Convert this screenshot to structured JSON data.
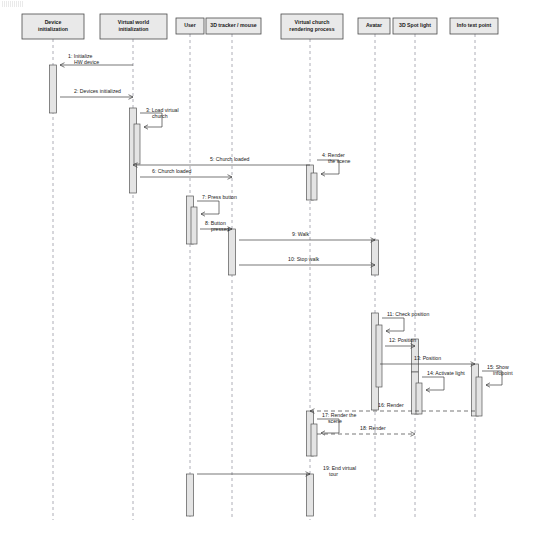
{
  "diagram": {
    "type": "uml-sequence-diagram",
    "canvas": {
      "width": 536,
      "height": 543
    },
    "colors": {
      "background": "#ffffff",
      "header_fill": "#e9e9e9",
      "header_stroke": "#4a4a4a",
      "activation_fill": "#e4e4e4",
      "activation_stroke": "#565656",
      "lifeline": "#9a9aa5",
      "message": "#3c3c3c",
      "text": "#1a1a1a"
    }
  },
  "lifelines": [
    {
      "id": "device-initialization",
      "label": "Device initialization",
      "x": 53,
      "box": {
        "x": 22,
        "y": 14,
        "w": 62,
        "h": 25
      },
      "lifeline_bottom": 520
    },
    {
      "id": "virtual-world-initialization",
      "label": "Virtual world initialization",
      "x": 133,
      "box": {
        "x": 100,
        "y": 14,
        "w": 67,
        "h": 25
      },
      "lifeline_bottom": 520
    },
    {
      "id": "user",
      "label": "User",
      "x": 190,
      "box": {
        "x": 176,
        "y": 18,
        "w": 28,
        "h": 16
      },
      "lifeline_bottom": 520
    },
    {
      "id": "tracker-mouse",
      "label": "3D tracker / mouse",
      "x": 232,
      "box": {
        "x": 206,
        "y": 18,
        "w": 55,
        "h": 16
      },
      "lifeline_bottom": 520
    },
    {
      "id": "virtual-church-rendering-process",
      "label": "Virtual church rendering process",
      "x": 310,
      "box": {
        "x": 281,
        "y": 14,
        "w": 62,
        "h": 25
      },
      "lifeline_bottom": 520
    },
    {
      "id": "avatar",
      "label": "Avatar",
      "x": 375,
      "box": {
        "x": 358,
        "y": 18,
        "w": 32,
        "h": 16
      },
      "lifeline_bottom": 520
    },
    {
      "id": "spot-light",
      "label": "3D Spot light",
      "x": 415,
      "box": {
        "x": 393,
        "y": 18,
        "w": 44,
        "h": 16
      },
      "lifeline_bottom": 520
    },
    {
      "id": "info-text-point",
      "label": "Info text point",
      "x": 475,
      "box": {
        "x": 450,
        "y": 18,
        "w": 48,
        "h": 16
      },
      "lifeline_bottom": 520
    }
  ],
  "activations": [
    {
      "id": "act-device-1",
      "lifeline": "device-initialization",
      "x": 53,
      "y": 65,
      "w": 7,
      "h": 48
    },
    {
      "id": "act-vworld-1",
      "lifeline": "virtual-world-initialization",
      "x": 133,
      "y": 108,
      "w": 7,
      "h": 85
    },
    {
      "id": "act-vworld-self",
      "lifeline": "virtual-world-initialization",
      "x": 137,
      "y": 124,
      "w": 6,
      "h": 40
    },
    {
      "id": "act-user-1",
      "lifeline": "user",
      "x": 190,
      "y": 196,
      "w": 7,
      "h": 48
    },
    {
      "id": "act-user-self",
      "lifeline": "user",
      "x": 194,
      "y": 207,
      "w": 6,
      "h": 37
    },
    {
      "id": "act-tracker-1",
      "lifeline": "tracker-mouse",
      "x": 232,
      "y": 229,
      "w": 7,
      "h": 46
    },
    {
      "id": "act-church-1",
      "lifeline": "virtual-church-rendering-process",
      "x": 310,
      "y": 165,
      "w": 7,
      "h": 35
    },
    {
      "id": "act-church-self",
      "lifeline": "virtual-church-rendering-process",
      "x": 314,
      "y": 173,
      "w": 6,
      "h": 27
    },
    {
      "id": "act-avatar-1",
      "lifeline": "avatar",
      "x": 375,
      "y": 240,
      "w": 7,
      "h": 35
    },
    {
      "id": "act-avatar-2",
      "lifeline": "avatar",
      "x": 375,
      "y": 313,
      "w": 7,
      "h": 97
    },
    {
      "id": "act-avatar-self",
      "lifeline": "avatar",
      "x": 379,
      "y": 325,
      "w": 6,
      "h": 62
    },
    {
      "id": "act-spot-1",
      "lifeline": "spot-light",
      "x": 415,
      "y": 339,
      "w": 7,
      "h": 33
    },
    {
      "id": "act-spot-2",
      "lifeline": "spot-light",
      "x": 415,
      "y": 372,
      "w": 7,
      "h": 42
    },
    {
      "id": "act-spot-self",
      "lifeline": "spot-light",
      "x": 419,
      "y": 383,
      "w": 6,
      "h": 31
    },
    {
      "id": "act-info-1",
      "lifeline": "info-text-point",
      "x": 475,
      "y": 364,
      "w": 7,
      "h": 52
    },
    {
      "id": "act-info-self",
      "lifeline": "info-text-point",
      "x": 479,
      "y": 377,
      "w": 6,
      "h": 39
    },
    {
      "id": "act-church-2",
      "lifeline": "virtual-church-rendering-process",
      "x": 310,
      "y": 411,
      "w": 7,
      "h": 45
    },
    {
      "id": "act-church-self2",
      "lifeline": "virtual-church-rendering-process",
      "x": 314,
      "y": 424,
      "w": 6,
      "h": 32
    },
    {
      "id": "act-user-2",
      "lifeline": "user",
      "x": 190,
      "y": 474,
      "w": 7,
      "h": 42
    },
    {
      "id": "act-church-3",
      "lifeline": "virtual-church-rendering-process",
      "x": 310,
      "y": 474,
      "w": 7,
      "h": 42
    }
  ],
  "messages": [
    {
      "n": 1,
      "label": "1: Initialize HW device",
      "from": "virtual-world-initialization",
      "to": "device-initialization",
      "kind": "call",
      "style": "solid",
      "x1": 133,
      "x2": 60,
      "y": 65,
      "label_x": 68,
      "label_y": 58,
      "lines": [
        "1: Initialize",
        "HW device"
      ]
    },
    {
      "n": 2,
      "label": "2: Devices initialized",
      "from": "device-initialization",
      "to": "virtual-world-initialization",
      "kind": "return",
      "style": "solid",
      "x1": 60,
      "x2": 133,
      "y": 97,
      "label_x": 74,
      "label_y": 93,
      "lines": [
        "2: Devices initialized"
      ]
    },
    {
      "n": 3,
      "label": "3: Load virtual church",
      "from": "virtual-world-initialization",
      "to": "virtual-world-initialization",
      "kind": "self",
      "style": "solid",
      "x": 140,
      "y": 113,
      "w": 22,
      "h": 14,
      "label_x": 146,
      "label_y": 112,
      "lines": [
        "3: Load virtual",
        "church"
      ]
    },
    {
      "n": 4,
      "label": "4: Render the scene",
      "from": "virtual-church-rendering-process",
      "to": "virtual-church-rendering-process",
      "kind": "self",
      "style": "solid",
      "x": 317,
      "y": 160,
      "w": 22,
      "h": 14,
      "label_x": 322,
      "label_y": 157,
      "lines": [
        "4: Render",
        "the scene"
      ]
    },
    {
      "n": 5,
      "label": "5: Church loaded",
      "from": "virtual-church-rendering-process",
      "to": "virtual-world-initialization",
      "kind": "return",
      "style": "solid",
      "x1": 310,
      "x2": 133,
      "y": 165,
      "label_x": 210,
      "label_y": 161,
      "lines": [
        "5: Church loaded"
      ]
    },
    {
      "n": 6,
      "label": "6: Church loaded",
      "from": "virtual-world-initialization",
      "to": "tracker-mouse",
      "kind": "call",
      "style": "solid",
      "x1": 140,
      "x2": 232,
      "y": 177,
      "label_x": 152,
      "label_y": 173,
      "lines": [
        "6: Church loaded"
      ]
    },
    {
      "n": 7,
      "label": "7: Press button",
      "from": "user",
      "to": "user",
      "kind": "self",
      "style": "solid",
      "x": 197,
      "y": 201,
      "w": 22,
      "h": 13,
      "label_x": 202,
      "label_y": 199,
      "lines": [
        "7: Press button"
      ]
    },
    {
      "n": 8,
      "label": "8: Button pressed",
      "from": "user",
      "to": "tracker-mouse",
      "kind": "call",
      "style": "solid",
      "x1": 200,
      "x2": 232,
      "y": 229,
      "label_x": 205,
      "label_y": 225,
      "lines": [
        "8: Button",
        "pressed"
      ]
    },
    {
      "n": 9,
      "label": "9: Walk",
      "from": "tracker-mouse",
      "to": "avatar",
      "kind": "call",
      "style": "solid",
      "x1": 239,
      "x2": 375,
      "y": 240,
      "label_x": 292,
      "label_y": 236,
      "lines": [
        "9: Walk"
      ]
    },
    {
      "n": 10,
      "label": "10: Stop walk",
      "from": "tracker-mouse",
      "to": "avatar",
      "kind": "call",
      "style": "solid",
      "x1": 239,
      "x2": 375,
      "y": 265,
      "label_x": 288,
      "label_y": 261,
      "lines": [
        "10: Stop walk"
      ]
    },
    {
      "n": 11,
      "label": "11: Check position",
      "from": "avatar",
      "to": "avatar",
      "kind": "self",
      "style": "solid",
      "x": 382,
      "y": 318,
      "w": 22,
      "h": 13,
      "label_x": 387,
      "label_y": 316,
      "lines": [
        "11: Check position"
      ]
    },
    {
      "n": 12,
      "label": "12: Position",
      "from": "avatar",
      "to": "spot-light",
      "kind": "call",
      "style": "solid",
      "x1": 385,
      "x2": 415,
      "y": 346,
      "label_x": 389,
      "label_y": 342,
      "lines": [
        "12: Position"
      ]
    },
    {
      "n": 13,
      "label": "13: Position",
      "from": "spot-light",
      "to": "info-text-point",
      "kind": "call",
      "style": "solid",
      "x1": 380,
      "x2": 475,
      "y": 364,
      "label_x": 414,
      "label_y": 360,
      "lines": [
        "13: Position"
      ]
    },
    {
      "n": 14,
      "label": "14: Activate light",
      "from": "spot-light",
      "to": "spot-light",
      "kind": "self",
      "style": "solid",
      "x": 422,
      "y": 377,
      "w": 22,
      "h": 13,
      "label_x": 427,
      "label_y": 375,
      "lines": [
        "14: Activate light"
      ]
    },
    {
      "n": 15,
      "label": "15: Show infopoint",
      "from": "info-text-point",
      "to": "info-text-point",
      "kind": "self",
      "style": "solid",
      "x": 482,
      "y": 371,
      "w": 20,
      "h": 14,
      "label_x": 487,
      "label_y": 369,
      "lines": [
        "15: Show",
        "infopoint"
      ]
    },
    {
      "n": 16,
      "label": "16: Render",
      "from": "info-text-point",
      "to": "virtual-church-rendering-process",
      "kind": "return",
      "style": "dashed",
      "x1": 475,
      "x2": 310,
      "y": 411,
      "label_x": 378,
      "label_y": 407,
      "lines": [
        "16: Render"
      ]
    },
    {
      "n": 17,
      "label": "17: Render the scene",
      "from": "virtual-church-rendering-process",
      "to": "virtual-church-rendering-process",
      "kind": "self",
      "style": "solid",
      "x": 317,
      "y": 419,
      "w": 22,
      "h": 14,
      "label_x": 322,
      "label_y": 417,
      "lines": [
        "17: Render the",
        "scene"
      ]
    },
    {
      "n": 18,
      "label": "18: Render",
      "from": "virtual-church-rendering-process",
      "to": "spot-light",
      "kind": "return",
      "style": "dashed",
      "x1": 317,
      "x2": 415,
      "y": 434,
      "label_x": 360,
      "label_y": 430,
      "lines": [
        "18: Render"
      ]
    },
    {
      "n": 19,
      "label": "19: End virtual tour",
      "from": "user",
      "to": "virtual-church-rendering-process",
      "kind": "call",
      "style": "solid",
      "x1": 197,
      "x2": 310,
      "y": 474,
      "label_x": 323,
      "label_y": 470,
      "lines": [
        "19: End virtual",
        "tour"
      ]
    }
  ]
}
